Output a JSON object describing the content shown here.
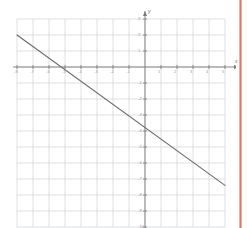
{
  "page": {
    "background_color": "#ffffff",
    "edge_color": "#d9796a"
  },
  "chart_data": {
    "type": "line",
    "title": "",
    "subtitle": "",
    "xlabel": "x",
    "ylabel": "y",
    "grid": true,
    "legend": false,
    "legend_position": "none",
    "xlim": [
      -8,
      5
    ],
    "ylim": [
      -10,
      3
    ],
    "xticks": [
      -8,
      -7,
      -6,
      -5,
      -4,
      -3,
      -2,
      -1,
      0,
      1,
      2,
      3,
      4,
      5
    ],
    "yticks": [
      3,
      2,
      1,
      0,
      -1,
      -2,
      -3,
      -4,
      -5,
      -6,
      -7,
      -8,
      -9,
      -10
    ],
    "xtick_labels": [
      "-8",
      "-7",
      "-6",
      "-5",
      "-4",
      "-3",
      "-2",
      "-1",
      "",
      "1",
      "2",
      "3",
      "4",
      "5"
    ],
    "ytick_labels": [
      "3",
      "2",
      "1",
      "",
      "-1",
      "-2",
      "-3",
      "-4",
      "-5",
      "-6",
      "-7",
      "-8",
      "-9",
      "-10"
    ],
    "series": [
      {
        "name": "line",
        "color": "#6b6b6b",
        "slope": -0.71,
        "y_intercept": -3.5,
        "x_intercept": -5.0,
        "equation": "y = -0.71x - 3.5",
        "points": [
          {
            "x": -8.0,
            "y": 2.0
          },
          {
            "x": -5.0,
            "y": 0.0
          },
          {
            "x": 0.0,
            "y": -3.5
          },
          {
            "x": 5.0,
            "y": -7.4
          }
        ]
      }
    ],
    "grid_color": "#d5d7dc",
    "axis_color": "#7a7a7a",
    "grid_cell_px": 16
  },
  "annotations": {
    "x_axis_label": "x",
    "y_axis_label": "y",
    "origin_label": "0"
  }
}
